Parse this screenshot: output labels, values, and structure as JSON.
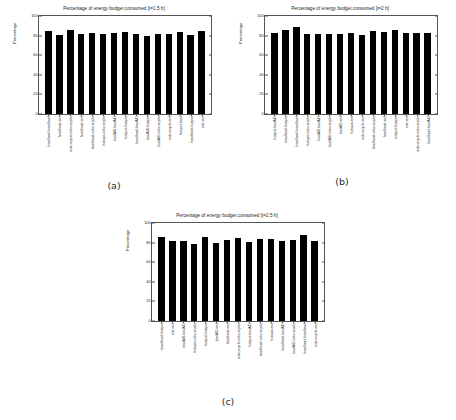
{
  "figure": {
    "panels": [
      {
        "caption": "(a)",
        "title": "Percentage of energy budget consumed [t=1.5 h]",
        "ylabel": "Percentage"
      },
      {
        "caption": "(b)",
        "title": "Percentage of energy budget consumed [t=2 h]",
        "ylabel": "Percentage"
      },
      {
        "caption": "(c)",
        "title": "Percentage of energy budget consumed [t=2.5 h]",
        "ylabel": "Percentage"
      }
    ]
  },
  "chart_data": [
    {
      "type": "bar",
      "title": "Percentage of energy budget consumed [t=1.5 h]",
      "xlabel": "",
      "ylabel": "Percentage",
      "ylim": [
        0,
        100
      ],
      "yticks": [
        0,
        20,
        40,
        60,
        80,
        100
      ],
      "grid": false,
      "legend": null,
      "bar_color": "#000000",
      "categories": [
        "headhead-headhead",
        "headhead-end",
        "reducecycle-reducecycle",
        "headhead-end",
        "headhead-reducecycle",
        "hotspot-reducecycle",
        "leadAID-leadAID",
        "hotspot-hotspot",
        "headhead-leadAID",
        "leadAID-hotspot",
        "leadAID-reducecycle",
        "reducecycle-end",
        "hotspot-head",
        "headhead-hotspot",
        "end-end"
      ],
      "values": [
        85,
        81,
        86,
        82,
        83,
        82,
        83,
        84,
        82,
        80,
        82,
        82,
        84,
        81,
        85
      ]
    },
    {
      "type": "bar",
      "title": "Percentage of energy budget consumed [t=2 h]",
      "xlabel": "",
      "ylabel": "Percentage",
      "ylim": [
        0,
        100
      ],
      "yticks": [
        0,
        20,
        40,
        60,
        80,
        100
      ],
      "grid": false,
      "legend": null,
      "bar_color": "#000000",
      "categories": [
        "hotspot-leadAID",
        "headhead-hotspot",
        "headhead-headhead",
        "hotspot-reducecycle",
        "leadAID-leadAID",
        "leadAID-reducecycle",
        "leadAID-end",
        "hotspot-end",
        "reducecycle-end",
        "headhead-reducecycle",
        "headhead-end",
        "hotspot-hotspot",
        "end-end",
        "reducecycle-reducecycle",
        "headhead-leadAID"
      ],
      "values": [
        83,
        86,
        89,
        82,
        82,
        82,
        82,
        83,
        81,
        85,
        84,
        86,
        83,
        83,
        83
      ]
    },
    {
      "type": "bar",
      "title": "Percentage of energy budget consumed [t=2.5 h]",
      "xlabel": "",
      "ylabel": "Percentage",
      "ylim": [
        0,
        100
      ],
      "yticks": [
        0,
        20,
        40,
        60,
        80,
        100
      ],
      "grid": false,
      "legend": null,
      "bar_color": "#000000",
      "categories": [
        "headhead-hotspot",
        "end-end",
        "leadAID-leadAID",
        "hotspot-reducecycle",
        "hotspot-hotspot",
        "leadAID-end",
        "headhead-end",
        "reducecycle-reducecycle",
        "hotspot-leadAID",
        "headhead-reducecycle",
        "hotspot-end",
        "headhead-leadAID",
        "leadAID-reducecycle",
        "headhead-headhead",
        "reducecycle-end"
      ],
      "values": [
        86,
        82,
        82,
        79,
        86,
        80,
        83,
        85,
        81,
        84,
        84,
        82,
        83,
        88,
        82
      ]
    }
  ]
}
